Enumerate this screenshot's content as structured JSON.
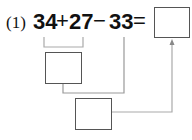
{
  "problem": {
    "label": "(1)",
    "operands": [
      "34",
      "27",
      "33"
    ],
    "operators": [
      "+",
      "−",
      "="
    ]
  },
  "boxes": {
    "result": "",
    "intermediate_1": "",
    "intermediate_2": ""
  },
  "colors": {
    "text": "#111111",
    "box_border": "#555555",
    "line": "#999999"
  }
}
